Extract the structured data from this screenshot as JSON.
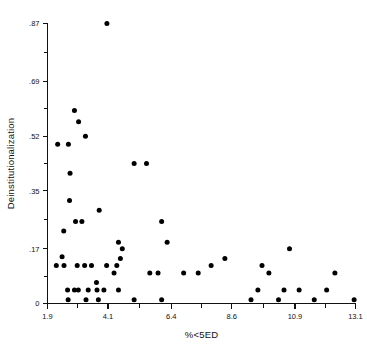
{
  "chart_data": {
    "type": "scatter",
    "title": "",
    "xlabel": "%<5ED",
    "ylabel": "Deinstitutionalization",
    "xlim": [
      1.9,
      13.1
    ],
    "ylim": [
      0,
      0.87
    ],
    "grid": false,
    "legend": "none",
    "xticks": [
      "1.9",
      "4.1",
      "6.4",
      "8.6",
      "10.9",
      "13.1"
    ],
    "xtick_values": [
      1.9,
      4.1,
      6.4,
      8.6,
      10.9,
      13.1
    ],
    "yticks": [
      "0",
      ".17",
      ".35",
      ".52",
      ".69",
      ".87"
    ],
    "ytick_values": [
      0,
      0.17,
      0.35,
      0.52,
      0.69,
      0.87
    ],
    "minor_ticks": true,
    "marker": "filled-circle",
    "marker_color": "#000000",
    "point_count": 59,
    "points": [
      [
        4.06,
        0.87
      ],
      [
        2.88,
        0.6
      ],
      [
        3.03,
        0.565
      ],
      [
        3.28,
        0.52
      ],
      [
        2.27,
        0.495
      ],
      [
        2.66,
        0.495
      ],
      [
        2.72,
        0.405
      ],
      [
        5.05,
        0.435
      ],
      [
        5.5,
        0.435
      ],
      [
        2.7,
        0.32
      ],
      [
        3.78,
        0.29
      ],
      [
        2.92,
        0.255
      ],
      [
        3.15,
        0.255
      ],
      [
        6.05,
        0.255
      ],
      [
        2.49,
        0.225
      ],
      [
        4.48,
        0.19
      ],
      [
        6.25,
        0.19
      ],
      [
        4.62,
        0.17
      ],
      [
        10.7,
        0.17
      ],
      [
        2.43,
        0.145
      ],
      [
        4.55,
        0.14
      ],
      [
        8.35,
        0.14
      ],
      [
        2.22,
        0.118
      ],
      [
        3.25,
        0.118
      ],
      [
        3.5,
        0.118
      ],
      [
        4.42,
        0.118
      ],
      [
        9.7,
        0.118
      ],
      [
        4.32,
        0.095
      ],
      [
        5.62,
        0.095
      ],
      [
        5.92,
        0.095
      ],
      [
        7.38,
        0.095
      ],
      [
        9.95,
        0.095
      ],
      [
        12.35,
        0.095
      ],
      [
        3.68,
        0.065
      ],
      [
        2.63,
        0.042
      ],
      [
        2.88,
        0.042
      ],
      [
        3.7,
        0.042
      ],
      [
        4.48,
        0.042
      ],
      [
        9.55,
        0.042
      ],
      [
        10.5,
        0.042
      ],
      [
        11.05,
        0.042
      ],
      [
        12.05,
        0.042
      ],
      [
        2.65,
        0.012
      ],
      [
        3.3,
        0.012
      ],
      [
        3.75,
        0.012
      ],
      [
        6.05,
        0.012
      ],
      [
        9.3,
        0.012
      ],
      [
        10.3,
        0.012
      ],
      [
        11.6,
        0.012
      ],
      [
        13.05,
        0.012
      ],
      [
        2.5,
        0.118
      ],
      [
        6.85,
        0.095
      ],
      [
        7.85,
        0.118
      ],
      [
        4.05,
        0.118
      ],
      [
        3.02,
        0.042
      ],
      [
        2.98,
        0.118
      ],
      [
        3.38,
        0.042
      ],
      [
        5.05,
        0.012
      ],
      [
        3.95,
        0.042
      ]
    ]
  },
  "axis": {
    "x_axis_name": "x-axis",
    "y_axis_name": "y-axis"
  }
}
